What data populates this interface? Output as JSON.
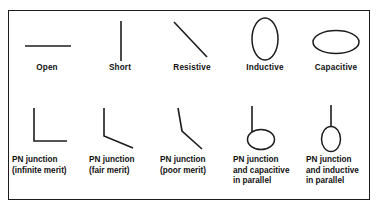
{
  "figure": {
    "border_color": "#1c1c1c",
    "stroke_color": "#1c1c1c",
    "background": "#ffffff",
    "rows": [
      {
        "id": "top-row",
        "items": [
          {
            "id": "open",
            "symbol_name": "horizontal-line-symbol",
            "caption_lines": [
              "Open"
            ]
          },
          {
            "id": "short",
            "symbol_name": "vertical-line-symbol",
            "caption_lines": [
              "Short"
            ]
          },
          {
            "id": "resistive",
            "symbol_name": "diagonal-line-symbol",
            "caption_lines": [
              "Resistive"
            ]
          },
          {
            "id": "inductive",
            "symbol_name": "vertical-ellipse-symbol",
            "caption_lines": [
              "Inductive"
            ]
          },
          {
            "id": "capacitive",
            "symbol_name": "horizontal-ellipse-symbol",
            "caption_lines": [
              "Capacitive"
            ]
          }
        ]
      },
      {
        "id": "bottom-row",
        "items": [
          {
            "id": "pn-junction-infinite-merit",
            "symbol_name": "right-angle-elbow-symbol",
            "caption_lines": [
              "PN junction",
              "(infinite merit)"
            ]
          },
          {
            "id": "pn-junction-fair-merit",
            "symbol_name": "obtuse-bend-symbol",
            "caption_lines": [
              "PN junction",
              "(fair merit)"
            ]
          },
          {
            "id": "pn-junction-poor-merit",
            "symbol_name": "shallow-bend-symbol",
            "caption_lines": [
              "PN junction",
              "(poor merit)"
            ]
          },
          {
            "id": "pn-junction-and-capacitive-in-parallel",
            "symbol_name": "line-with-horizontal-loop-symbol",
            "caption_lines": [
              "PN junction",
              "and capacitive",
              "in parallel"
            ]
          },
          {
            "id": "pn-junction-and-inductive-in-parallel",
            "symbol_name": "line-with-vertical-loop-symbol",
            "caption_lines": [
              "PN junction",
              "and inductive",
              "in parallel"
            ]
          }
        ]
      }
    ]
  }
}
